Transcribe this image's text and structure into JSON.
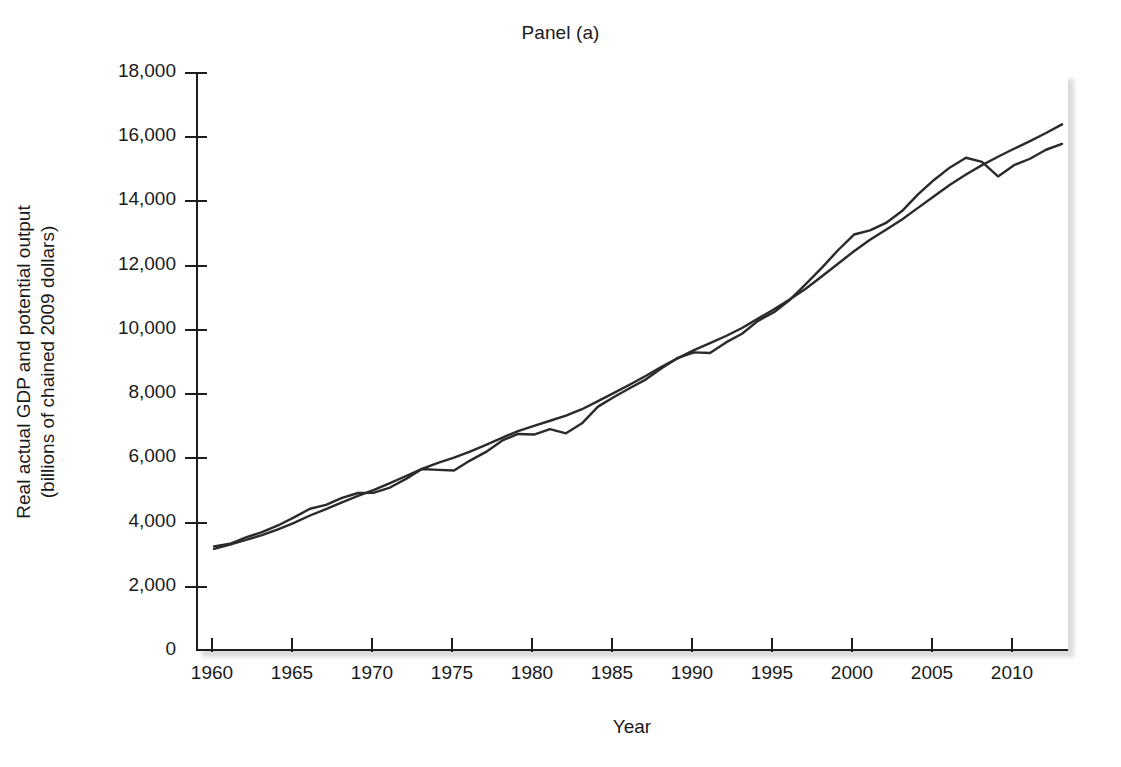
{
  "figure": {
    "title": "Panel (a)",
    "xlabel": "Year",
    "ylabel_line1": "Real actual GDP and potential output",
    "ylabel_line2": "(billions of chained 2009 dollars)"
  },
  "chart_data": {
    "type": "line",
    "title": "Panel (a)",
    "subtitle": "",
    "xlabel": "Year",
    "ylabel": "Real actual GDP and potential output (billions of chained 2009 dollars)",
    "xlim": [
      1959,
      2013.5
    ],
    "ylim": [
      0,
      18000
    ],
    "xticks": [
      1960,
      1965,
      1970,
      1975,
      1980,
      1985,
      1990,
      1995,
      2000,
      2005,
      2010
    ],
    "xtick_labels": [
      "1960",
      "1965",
      "1970",
      "1975",
      "1980",
      "1985",
      "1990",
      "1995",
      "2000",
      "2005",
      "2010"
    ],
    "yticks": [
      0,
      2000,
      4000,
      6000,
      8000,
      10000,
      12000,
      14000,
      16000,
      18000
    ],
    "ytick_labels": [
      "0",
      "2,000",
      "4,000",
      "6,000",
      "8,000",
      "10,000",
      "12,000",
      "14,000",
      "16,000",
      "18,000"
    ],
    "grid": false,
    "legend": false,
    "legend_position": "none",
    "line_color": "#2a2a2a",
    "x": [
      1960,
      1961,
      1962,
      1963,
      1964,
      1965,
      1966,
      1967,
      1968,
      1969,
      1970,
      1971,
      1972,
      1973,
      1974,
      1975,
      1976,
      1977,
      1978,
      1979,
      1980,
      1981,
      1982,
      1983,
      1984,
      1985,
      1986,
      1987,
      1988,
      1989,
      1990,
      1991,
      1992,
      1993,
      1994,
      1995,
      1996,
      1997,
      1998,
      1999,
      2000,
      2001,
      2002,
      2003,
      2004,
      2005,
      2006,
      2007,
      2008,
      2009,
      2010,
      2011,
      2012,
      2013
    ],
    "series": [
      {
        "name": "Real actual GDP",
        "values": [
          3260,
          3340,
          3540,
          3700,
          3910,
          4160,
          4430,
          4550,
          4770,
          4920,
          4930,
          5090,
          5360,
          5670,
          5640,
          5620,
          5930,
          6200,
          6550,
          6760,
          6740,
          6910,
          6780,
          7090,
          7610,
          7910,
          8190,
          8460,
          8810,
          9130,
          9300,
          9280,
          9610,
          9880,
          10280,
          10550,
          10940,
          11430,
          11940,
          12480,
          12970,
          13100,
          13330,
          13700,
          14220,
          14670,
          15060,
          15360,
          15230,
          14780,
          15130,
          15330,
          15610,
          15790
        ],
        "style": "solid"
      },
      {
        "name": "Potential output",
        "values": [
          3180,
          3310,
          3460,
          3610,
          3790,
          3990,
          4220,
          4420,
          4630,
          4830,
          5020,
          5230,
          5450,
          5670,
          5860,
          6020,
          6210,
          6420,
          6640,
          6850,
          7010,
          7170,
          7330,
          7530,
          7780,
          8040,
          8300,
          8570,
          8860,
          9120,
          9370,
          9590,
          9810,
          10060,
          10350,
          10640,
          10950,
          11290,
          11670,
          12060,
          12450,
          12810,
          13120,
          13440,
          13800,
          14160,
          14520,
          14840,
          15130,
          15390,
          15640,
          15880,
          16130,
          16400
        ],
        "style": "solid"
      }
    ],
    "annotations": []
  }
}
